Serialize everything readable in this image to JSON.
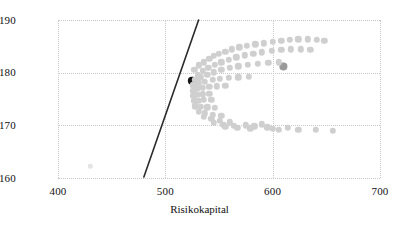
{
  "chart_data": {
    "type": "scatter",
    "title": "",
    "xlabel": "Risikokapital",
    "ylabel": "Ertrag",
    "xlim": [
      400,
      700
    ],
    "ylim": [
      160,
      190
    ],
    "xticks": [
      400,
      500,
      600,
      700
    ],
    "yticks": [
      160,
      170,
      180,
      190
    ],
    "grid": true,
    "legend": "none",
    "colors": {
      "cloud_point": "#cfcfcf",
      "highlight_point": "#161616",
      "secondary_point": "#9a9a9a",
      "faint_point": "#e4e4e4",
      "trend_line": "#2b2b2b",
      "gridline": "#c9c9c9",
      "axis_text": "#111111"
    },
    "series": [
      {
        "name": "efficient-frontier-line",
        "type": "line",
        "color": "#2b2b2b",
        "x": [
          480,
          531
        ],
        "y": [
          160.2,
          190.0
        ]
      },
      {
        "name": "highlight-portfolio",
        "type": "scatter",
        "color": "#161616",
        "radius_px": 4.2,
        "points": [
          [
            525,
            178.4
          ]
        ]
      },
      {
        "name": "secondary-portfolio",
        "type": "scatter",
        "color": "#9a9a9a",
        "radius_px": 3.6,
        "points": [
          [
            610,
            181.2
          ]
        ]
      },
      {
        "name": "faint-outlier",
        "type": "scatter",
        "color": "#e4e4e4",
        "radius_px": 2.2,
        "points": [
          [
            430,
            162.2
          ]
        ]
      },
      {
        "name": "portfolio-cloud",
        "type": "scatter",
        "color": "#cfcfcf",
        "radius_px": 3.2,
        "points": [
          [
            527,
            180.6
          ],
          [
            531,
            181.4
          ],
          [
            536,
            182.0
          ],
          [
            541,
            182.6
          ],
          [
            545,
            183.2
          ],
          [
            550,
            183.6
          ],
          [
            556,
            184.0
          ],
          [
            562,
            184.4
          ],
          [
            569,
            184.8
          ],
          [
            576,
            185.1
          ],
          [
            584,
            185.4
          ],
          [
            592,
            185.6
          ],
          [
            600,
            185.9
          ],
          [
            608,
            186.1
          ],
          [
            616,
            186.2
          ],
          [
            624,
            186.3
          ],
          [
            633,
            186.3
          ],
          [
            641,
            186.2
          ],
          [
            648,
            186.0
          ],
          [
            530,
            179.6
          ],
          [
            535,
            180.3
          ],
          [
            540,
            180.9
          ],
          [
            546,
            181.5
          ],
          [
            552,
            182.0
          ],
          [
            559,
            182.5
          ],
          [
            566,
            182.9
          ],
          [
            574,
            183.3
          ],
          [
            582,
            183.6
          ],
          [
            590,
            183.9
          ],
          [
            599,
            184.1
          ],
          [
            608,
            184.3
          ],
          [
            617,
            184.4
          ],
          [
            626,
            184.4
          ],
          [
            635,
            184.3
          ],
          [
            528,
            178.6
          ],
          [
            533,
            179.1
          ],
          [
            539,
            179.6
          ],
          [
            545,
            180.1
          ],
          [
            552,
            180.5
          ],
          [
            560,
            180.9
          ],
          [
            568,
            181.2
          ],
          [
            577,
            181.5
          ],
          [
            586,
            181.7
          ],
          [
            596,
            181.9
          ],
          [
            606,
            182.0
          ],
          [
            526,
            177.6
          ],
          [
            531,
            178.0
          ],
          [
            537,
            178.3
          ],
          [
            544,
            178.6
          ],
          [
            551,
            178.8
          ],
          [
            559,
            179.0
          ],
          [
            568,
            179.1
          ],
          [
            578,
            179.2
          ],
          [
            526,
            176.6
          ],
          [
            530,
            176.9
          ],
          [
            535,
            177.1
          ],
          [
            541,
            177.3
          ],
          [
            548,
            177.4
          ],
          [
            556,
            177.5
          ],
          [
            526,
            175.6
          ],
          [
            530,
            175.8
          ],
          [
            535,
            175.9
          ],
          [
            541,
            176.0
          ],
          [
            527,
            174.6
          ],
          [
            531,
            174.7
          ],
          [
            536,
            174.8
          ],
          [
            543,
            174.8
          ],
          [
            528,
            173.6
          ],
          [
            533,
            173.5
          ],
          [
            539,
            173.4
          ],
          [
            546,
            173.3
          ],
          [
            531,
            172.6
          ],
          [
            537,
            172.3
          ],
          [
            544,
            172.0
          ],
          [
            552,
            171.8
          ],
          [
            536,
            171.6
          ],
          [
            543,
            171.2
          ],
          [
            551,
            170.9
          ],
          [
            560,
            170.6
          ],
          [
            545,
            170.5
          ],
          [
            554,
            170.1
          ],
          [
            564,
            169.9
          ],
          [
            556,
            169.7
          ],
          [
            567,
            169.5
          ],
          [
            579,
            169.4
          ],
          [
            590,
            170.2
          ],
          [
            595,
            169.6
          ],
          [
            600,
            169.3
          ],
          [
            606,
            169.2
          ],
          [
            614,
            169.5
          ],
          [
            624,
            169.2
          ],
          [
            640,
            169.1
          ],
          [
            656,
            169.0
          ],
          [
            575,
            170.0
          ],
          [
            583,
            169.8
          ]
        ]
      }
    ]
  },
  "axes": {
    "x_title": "Risikokapital",
    "y_title": "Ertrag",
    "x_tick_labels": [
      "400",
      "500",
      "600",
      "700"
    ],
    "y_tick_labels": [
      "190",
      "180",
      "170",
      "160"
    ]
  }
}
